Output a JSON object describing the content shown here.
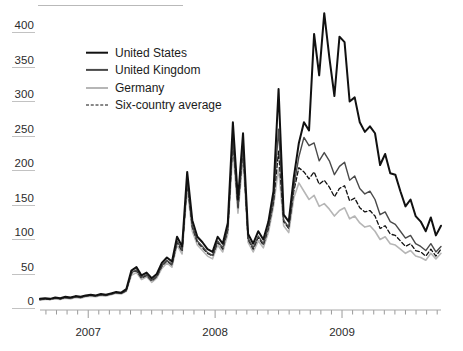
{
  "chart_data": {
    "type": "line",
    "title": "",
    "subtitle": "",
    "xlabel": "",
    "ylabel": "",
    "grid": false,
    "legend_position": "top-left",
    "xlim": [
      2006.62,
      2009.78
    ],
    "ylim": [
      0,
      420
    ],
    "yticks": [
      0,
      50,
      100,
      150,
      200,
      250,
      300,
      350,
      400
    ],
    "ytick_labels": [
      "0",
      "50",
      "100",
      "150",
      "200",
      "250",
      "300",
      "350",
      "400"
    ],
    "xticks": [
      2007,
      2008,
      2009
    ],
    "xtick_labels": [
      "2007",
      "2008",
      "2009"
    ],
    "x_minor_tick_interval_months": 1,
    "x": [
      2006.62,
      2006.66,
      2006.7,
      2006.74,
      2006.78,
      2006.82,
      2006.86,
      2006.9,
      2006.94,
      2006.98,
      2007.02,
      2007.06,
      2007.1,
      2007.14,
      2007.18,
      2007.22,
      2007.26,
      2007.3,
      2007.34,
      2007.38,
      2007.42,
      2007.46,
      2007.5,
      2007.54,
      2007.58,
      2007.62,
      2007.66,
      2007.7,
      2007.74,
      2007.78,
      2007.82,
      2007.86,
      2007.9,
      2007.94,
      2007.98,
      2008.02,
      2008.06,
      2008.1,
      2008.14,
      2008.18,
      2008.22,
      2008.26,
      2008.3,
      2008.34,
      2008.38,
      2008.42,
      2008.46,
      2008.5,
      2008.54,
      2008.58,
      2008.62,
      2008.66,
      2008.7,
      2008.74,
      2008.78,
      2008.82,
      2008.86,
      2008.9,
      2008.94,
      2008.98,
      2009.02,
      2009.06,
      2009.1,
      2009.14,
      2009.18,
      2009.22,
      2009.26,
      2009.3,
      2009.34,
      2009.38,
      2009.42,
      2009.46,
      2009.5,
      2009.54,
      2009.58,
      2009.62,
      2009.66,
      2009.7,
      2009.74,
      2009.78
    ],
    "series": [
      {
        "name": "United States",
        "color": "#111111",
        "style": "solid",
        "width": 2.0,
        "values": [
          6,
          7,
          6,
          8,
          7,
          9,
          8,
          10,
          9,
          11,
          12,
          11,
          13,
          12,
          14,
          16,
          15,
          20,
          47,
          52,
          40,
          44,
          36,
          42,
          58,
          66,
          60,
          96,
          82,
          190,
          120,
          96,
          88,
          78,
          74,
          96,
          86,
          116,
          262,
          150,
          246,
          100,
          86,
          104,
          92,
          118,
          162,
          310,
          128,
          118,
          182,
          232,
          262,
          250,
          390,
          330,
          420,
          356,
          300,
          386,
          378,
          292,
          298,
          262,
          248,
          256,
          246,
          200,
          216,
          188,
          186,
          162,
          140,
          150,
          126,
          118,
          104,
          124,
          98,
          112
        ]
      },
      {
        "name": "United Kingdom",
        "color": "#4a4a4a",
        "style": "solid",
        "width": 1.4,
        "values": [
          5,
          6,
          6,
          7,
          6,
          8,
          7,
          9,
          8,
          10,
          11,
          10,
          12,
          11,
          13,
          15,
          14,
          18,
          44,
          48,
          37,
          41,
          33,
          39,
          54,
          62,
          56,
          90,
          77,
          178,
          112,
          90,
          82,
          73,
          69,
          90,
          80,
          108,
          240,
          140,
          226,
          94,
          80,
          97,
          86,
          110,
          150,
          252,
          120,
          110,
          168,
          212,
          240,
          228,
          232,
          206,
          218,
          206,
          186,
          198,
          204,
          178,
          184,
          166,
          158,
          162,
          150,
          128,
          132,
          118,
          114,
          104,
          94,
          98,
          86,
          82,
          76,
          86,
          74,
          82
        ]
      },
      {
        "name": "Germany",
        "color": "#b6b6b6",
        "style": "solid",
        "width": 1.6,
        "values": [
          4,
          5,
          5,
          6,
          5,
          7,
          6,
          8,
          7,
          9,
          10,
          9,
          11,
          10,
          12,
          14,
          13,
          17,
          40,
          44,
          34,
          38,
          30,
          36,
          50,
          58,
          52,
          84,
          71,
          166,
          104,
          84,
          76,
          68,
          64,
          84,
          74,
          100,
          222,
          130,
          210,
          88,
          74,
          90,
          80,
          102,
          140,
          196,
          112,
          102,
          152,
          174,
          162,
          150,
          156,
          140,
          144,
          136,
          126,
          134,
          138,
          122,
          126,
          116,
          110,
          112,
          104,
          92,
          96,
          86,
          84,
          78,
          72,
          76,
          68,
          66,
          62,
          72,
          64,
          72
        ]
      },
      {
        "name": "Six-country average",
        "color": "#111111",
        "style": "dashed",
        "width": 1.3,
        "values": [
          5,
          6,
          5,
          7,
          6,
          8,
          7,
          9,
          8,
          10,
          11,
          10,
          12,
          11,
          13,
          15,
          14,
          18,
          43,
          47,
          36,
          40,
          32,
          38,
          53,
          61,
          55,
          88,
          75,
          174,
          110,
          88,
          80,
          72,
          68,
          88,
          78,
          106,
          236,
          137,
          222,
          92,
          78,
          95,
          84,
          108,
          146,
          220,
          118,
          108,
          162,
          196,
          190,
          180,
          190,
          172,
          178,
          168,
          154,
          166,
          170,
          148,
          152,
          138,
          132,
          134,
          126,
          108,
          112,
          100,
          98,
          90,
          82,
          86,
          76,
          74,
          68,
          78,
          68,
          78
        ]
      }
    ]
  },
  "legend": {
    "items": [
      {
        "label": "United States"
      },
      {
        "label": "United Kingdom"
      },
      {
        "label": "Germany"
      },
      {
        "label": "Six-country average"
      }
    ]
  },
  "axes": {
    "y_tick_labels": [
      "400",
      "350",
      "300",
      "250",
      "200",
      "150",
      "100",
      "50",
      "0"
    ],
    "x_tick_labels": [
      "2007",
      "2008",
      "2009"
    ]
  }
}
